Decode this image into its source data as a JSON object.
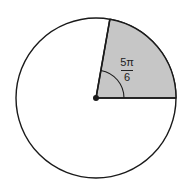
{
  "figure": {
    "background_color": "#ffffff",
    "stroke_color": "#1a1a1a",
    "sector_fill_color": "#c6c6c6",
    "label_color": "#222222"
  },
  "circle": {
    "center_x": 96,
    "center_y": 98,
    "radius": 80,
    "fill": "#ffffff"
  },
  "sector": {
    "shaded": true,
    "start_angle_deg": 0,
    "end_angle_deg": 80,
    "fill": "#c6c6c6"
  },
  "angle_label": {
    "numerator": "5π",
    "denominator": "6",
    "full_text": "5π/6"
  },
  "center_point": {
    "label": "center-dot",
    "radius": 3,
    "color": "#1a1a1a"
  },
  "angle_arc": {
    "radius": 28,
    "color": "#1a1a1a"
  },
  "radii": [
    {
      "name": "horizontal-radius",
      "angle_deg": 0
    },
    {
      "name": "upper-radius",
      "angle_deg": 80
    }
  ]
}
